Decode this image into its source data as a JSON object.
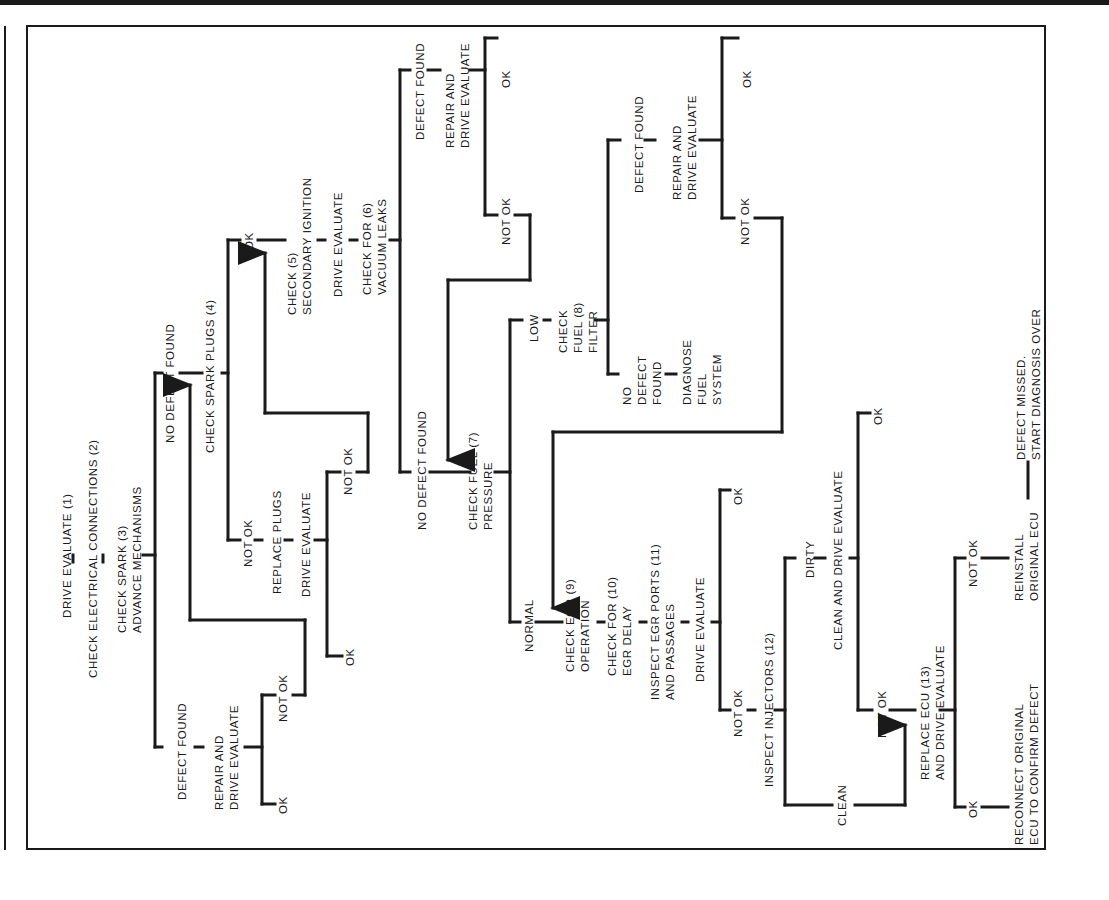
{
  "diagram": {
    "orientation": "rotated-90-ccw",
    "line_color": "#1a1a1a",
    "background": "#ffffff",
    "steps": {
      "drive_evaluate_1": "DRIVE EVALUATE (1)",
      "check_electrical_2": "CHECK ELECTRICAL CONNECTIONS (2)",
      "check_spark_3": "CHECK SPARK (3)\nADVANCE MECHANISMS",
      "defect_found_a": "DEFECT FOUND",
      "repair_drive_a": "REPAIR AND\nDRIVE EVALUATE",
      "ok_a": "OK",
      "not_ok_a": "NOT OK",
      "no_defect_found_a": "NO DEFECT FOUND",
      "check_spark_plugs_4": "CHECK SPARK PLUGS (4)",
      "not_ok_plugs": "NOT OK",
      "replace_plugs": "REPLACE PLUGS",
      "drive_evaluate_plugs": "DRIVE EVALUATE",
      "ok_plugs": "OK",
      "not_ok_plugs2": "NOT OK",
      "ok_spark": "OK",
      "check_secondary_5": "CHECK (5)\nSECONDARY IGNITION",
      "drive_evaluate_5": "DRIVE EVALUATE",
      "check_vacuum_6": "CHECK FOR (6)\nVACUUM LEAKS",
      "defect_found_b": "DEFECT FOUND",
      "repair_drive_b": "REPAIR AND\nDRIVE EVALUATE",
      "ok_b": "OK",
      "not_ok_b": "NOT OK",
      "no_defect_found_b": "NO DEFECT FOUND",
      "check_fuel_pressure_7": "CHECK FUEL (7)\nPRESSURE",
      "low": "LOW",
      "check_fuel_filter_8": "CHECK\nFUEL (8)\nFILTER",
      "defect_found_c": "DEFECT FOUND",
      "repair_drive_c": "REPAIR AND\nDRIVE EVALUATE",
      "ok_c": "OK",
      "not_ok_c": "NOT OK",
      "no_defect_found_c": "NO\nDEFECT\nFOUND",
      "diagnose_fuel_system": "DIAGNOSE\nFUEL\nSYSTEM",
      "normal": "NORMAL",
      "check_egr_9": "CHECK EGR (9)\nOPERATION",
      "check_egr_delay_10": "CHECK FOR (10)\nEGR DELAY",
      "inspect_egr_ports_11": "INSPECT EGR PORTS (11)\nAND PASSAGES",
      "drive_evaluate_egr": "DRIVE EVALUATE",
      "ok_egr": "OK",
      "not_ok_egr": "NOT OK",
      "inspect_injectors_12": "INSPECT INJECTORS (12)",
      "dirty": "DIRTY",
      "clean_drive_evaluate": "CLEAN AND DRIVE EVALUATE",
      "ok_inj": "OK",
      "not_ok_inj": "NOT OK",
      "clean": "CLEAN",
      "replace_ecu_13": "REPLACE ECU (13)\nAND DRIVE EVALUATE",
      "not_ok_ecu": "NOT OK",
      "reinstall_ecu": "REINSTALL\nORIGINAL ECU",
      "defect_missed": "DEFECT MISSED.\nSTART DIAGNOSIS OVER",
      "ok_ecu": "OK",
      "reconnect_ecu": "RECONNECT ORIGINAL\nECU TO CONFIRM DEFECT"
    }
  }
}
